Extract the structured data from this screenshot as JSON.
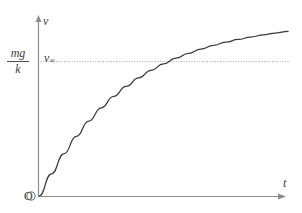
{
  "figure": {
    "background_color": "#ffffff",
    "axis_color": "#8c8c8c",
    "curve_color": "#3a3a3a",
    "asymptote_color": "#9a9a9a",
    "text_color": "#3c3c3c",
    "origin_label": "O",
    "y_axis_tip_label": "v",
    "x_axis_tip_label": "t",
    "asymptote_label_main": "v",
    "asymptote_label_sub": "∞",
    "y_tick_label": {
      "numerator": "mg",
      "denominator": "k"
    }
  },
  "chart_data": {
    "type": "line",
    "title": "",
    "xlabel": "t",
    "ylabel": "v",
    "grid": false,
    "legend": null,
    "xlim": [
      0,
      1
    ],
    "ylim": [
      0,
      1.12
    ],
    "axis_arrows": [
      "x-right",
      "y-up"
    ],
    "tick_labels": {
      "y": [
        "mg/k"
      ],
      "x": []
    },
    "annotations": [
      {
        "text": "O",
        "x": 0,
        "y": 0,
        "role": "origin-marker"
      },
      {
        "text": "mg/k",
        "x": 0,
        "y": 1,
        "role": "y-axis-tick-label"
      },
      {
        "text": "v∞",
        "x": 0.04,
        "y": 1.04,
        "role": "asymptote-label"
      },
      {
        "text": "v",
        "x": 0,
        "y": 1.12,
        "role": "y-axis-name"
      },
      {
        "text": "t",
        "x": 1,
        "y": 0.06,
        "role": "x-axis-name"
      }
    ],
    "series": [
      {
        "name": "v(t) = (mg/k)(1 - e^(-kt/m))",
        "style": "solid",
        "x": [
          0,
          0.05,
          0.1,
          0.15,
          0.2,
          0.25,
          0.3,
          0.35,
          0.4,
          0.45,
          0.5,
          0.55,
          0.6,
          0.65,
          0.7,
          0.75,
          0.8,
          0.85,
          0.9,
          0.95,
          1.0
        ],
        "y": [
          0,
          0.165,
          0.313,
          0.442,
          0.555,
          0.654,
          0.739,
          0.813,
          0.877,
          0.932,
          0.98,
          1.022,
          1.058,
          1.09,
          1.117,
          1.141,
          1.161,
          1.179,
          1.195,
          1.209,
          1.221
        ]
      },
      {
        "name": "asymptote v = mg/k",
        "style": "dotted",
        "x": [
          0,
          1
        ],
        "y": [
          1,
          1
        ]
      }
    ]
  }
}
